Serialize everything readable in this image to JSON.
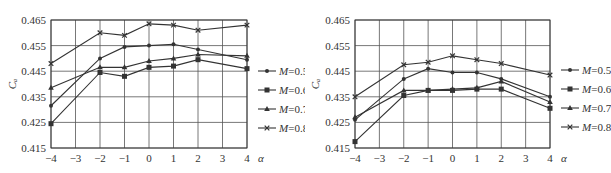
{
  "header": {
    "caption_fragment": ""
  },
  "chart_data": [
    {
      "type": "line",
      "title": "",
      "xlabel": "α",
      "ylabel": "Cₐ",
      "x": [
        -4,
        -2,
        -1,
        0,
        1,
        2,
        4
      ],
      "xticks": [
        -4,
        -3,
        -2,
        -1,
        0,
        1,
        2,
        3,
        4
      ],
      "xtick_labels": [
        "−4",
        "−3",
        "−2",
        "−1",
        "0",
        "1",
        "2",
        "3",
        "4"
      ],
      "yticks": [
        0.415,
        0.425,
        0.435,
        0.445,
        0.455,
        0.465
      ],
      "ytick_labels": [
        "0.415",
        "0.425",
        "0.435",
        "0.445",
        "0.455",
        "0.465"
      ],
      "xlim": [
        -4,
        4
      ],
      "ylim": [
        0.415,
        0.465
      ],
      "grid": true,
      "legend_position": "right",
      "series": [
        {
          "name": "M=0.5",
          "marker": "dot",
          "values": [
            0.4315,
            0.45,
            0.4545,
            0.455,
            0.4555,
            0.4535,
            0.4495
          ]
        },
        {
          "name": "M=0.6",
          "marker": "square",
          "values": [
            0.4245,
            0.4445,
            0.443,
            0.4465,
            0.447,
            0.4495,
            0.446
          ]
        },
        {
          "name": "M=0.7",
          "marker": "triangle",
          "values": [
            0.4385,
            0.4465,
            0.4465,
            0.449,
            0.45,
            0.4515,
            0.451
          ]
        },
        {
          "name": "M=0.8",
          "marker": "cross",
          "values": [
            0.448,
            0.46,
            0.459,
            0.4635,
            0.463,
            0.461,
            0.463
          ]
        }
      ]
    },
    {
      "type": "line",
      "title": "",
      "xlabel": "α",
      "ylabel": "Cₐ",
      "x": [
        -4,
        -2,
        -1,
        0,
        1,
        2,
        4
      ],
      "xticks": [
        -4,
        -3,
        -2,
        -1,
        0,
        1,
        2,
        3,
        4
      ],
      "xtick_labels": [
        "−4",
        "−3",
        "−2",
        "−1",
        "0",
        "1",
        "2",
        "3",
        "4"
      ],
      "yticks": [
        0.415,
        0.425,
        0.435,
        0.445,
        0.455,
        0.465
      ],
      "ytick_labels": [
        "0.415",
        "0.425",
        "0.435",
        "0.445",
        "0.455",
        "0.465"
      ],
      "xlim": [
        -4,
        4
      ],
      "ylim": [
        0.415,
        0.465
      ],
      "grid": true,
      "legend_position": "right",
      "series": [
        {
          "name": "M=0.5",
          "marker": "dot",
          "values": [
            0.426,
            0.442,
            0.446,
            0.4445,
            0.4445,
            0.442,
            0.435
          ]
        },
        {
          "name": "M=0.6",
          "marker": "square",
          "values": [
            0.4175,
            0.4355,
            0.4375,
            0.4375,
            0.438,
            0.438,
            0.4305
          ]
        },
        {
          "name": "M=0.7",
          "marker": "triangle",
          "values": [
            0.427,
            0.4375,
            0.4375,
            0.438,
            0.4385,
            0.441,
            0.433
          ]
        },
        {
          "name": "M=0.8",
          "marker": "cross",
          "values": [
            0.435,
            0.4475,
            0.4485,
            0.451,
            0.4495,
            0.448,
            0.4435
          ]
        }
      ]
    }
  ],
  "legend": {
    "items": [
      {
        "var": "M",
        "value": "=0.5",
        "marker": "dot"
      },
      {
        "var": "M",
        "value": "=0.6",
        "marker": "square"
      },
      {
        "var": "M",
        "value": "=0.7",
        "marker": "triangle"
      },
      {
        "var": "M",
        "value": "=0.8",
        "marker": "cross"
      }
    ]
  },
  "colors": {
    "line": "#333333",
    "grid": "#555555",
    "axis": "#333333"
  }
}
